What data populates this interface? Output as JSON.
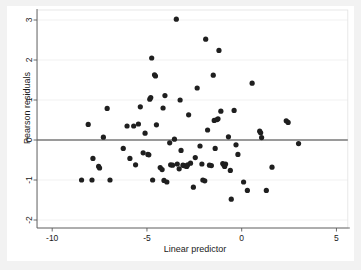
{
  "figure": {
    "background": "#f2f2f2",
    "plot_background": "#ffffff",
    "marker_color": "#1f1f1f",
    "gridline_color": "#ebebeb",
    "zero_line_color": "#3d3d3d"
  },
  "chart_data": {
    "type": "scatter",
    "title": "",
    "subtitle": "",
    "xlabel": "Linear predictor",
    "ylabel": "Pearson residuals",
    "xlim": [
      -10.8,
      5.6
    ],
    "ylim": [
      -2.2,
      3.25
    ],
    "xticks": [
      -10,
      -5,
      0,
      5
    ],
    "xticklabels": [
      "-10",
      "-5",
      "0",
      "5"
    ],
    "yticks": [
      -2,
      -1,
      0,
      1,
      2,
      3
    ],
    "yticklabels": [
      "-2",
      "-1",
      "0",
      "1",
      "2",
      "3"
    ],
    "grid": "horizontal",
    "legend": "none",
    "reference_lines": [
      {
        "axis": "y",
        "value": 0,
        "style": "solid"
      }
    ],
    "marker": {
      "shape": "circle",
      "size": 2.6
    },
    "series": [
      {
        "name": "Pearson residuals",
        "points": [
          [
            -8.45,
            -1.0
          ],
          [
            -8.1,
            0.39
          ],
          [
            -7.9,
            -1.0
          ],
          [
            -7.85,
            -0.46
          ],
          [
            -7.55,
            -0.66
          ],
          [
            -7.5,
            -0.7
          ],
          [
            -7.3,
            0.07
          ],
          [
            -7.1,
            0.79
          ],
          [
            -6.95,
            -1.0
          ],
          [
            -6.25,
            -0.21
          ],
          [
            -6.05,
            0.35
          ],
          [
            -5.9,
            -0.46
          ],
          [
            -5.7,
            0.35
          ],
          [
            -5.6,
            -0.62
          ],
          [
            -5.45,
            0.4
          ],
          [
            -5.35,
            0.83
          ],
          [
            -5.2,
            -0.32
          ],
          [
            -5.1,
            0.17
          ],
          [
            -4.95,
            -0.36
          ],
          [
            -4.9,
            -0.37
          ],
          [
            -4.85,
            1.02
          ],
          [
            -4.8,
            1.06
          ],
          [
            -4.75,
            2.05
          ],
          [
            -4.7,
            -1.0
          ],
          [
            -4.6,
            1.63
          ],
          [
            -4.55,
            1.6
          ],
          [
            -4.5,
            0.38
          ],
          [
            -4.3,
            -0.69
          ],
          [
            -4.2,
            -0.74
          ],
          [
            -4.15,
            0.8
          ],
          [
            -4.1,
            -1.01
          ],
          [
            -4.05,
            1.11
          ],
          [
            -3.95,
            -1.05
          ],
          [
            -3.8,
            -0.07
          ],
          [
            -3.75,
            -0.62
          ],
          [
            -3.65,
            -0.63
          ],
          [
            -3.55,
            0.02
          ],
          [
            -3.45,
            3.02
          ],
          [
            -3.4,
            -0.6
          ],
          [
            -3.3,
            -0.72
          ],
          [
            -3.25,
            1.0
          ],
          [
            -3.2,
            -0.26
          ],
          [
            -3.1,
            -0.63
          ],
          [
            -3.05,
            -0.64
          ],
          [
            -2.95,
            -0.65
          ],
          [
            -2.9,
            -0.66
          ],
          [
            -2.85,
            -0.62
          ],
          [
            -2.8,
            0.63
          ],
          [
            -2.7,
            -0.58
          ],
          [
            -2.55,
            -1.18
          ],
          [
            -2.45,
            -0.44
          ],
          [
            -2.35,
            1.3
          ],
          [
            -2.2,
            -0.15
          ],
          [
            -2.1,
            -0.6
          ],
          [
            -2.05,
            -1.0
          ],
          [
            -1.95,
            -1.02
          ],
          [
            -1.9,
            2.52
          ],
          [
            -1.8,
            0.25
          ],
          [
            -1.7,
            -0.63
          ],
          [
            -1.6,
            -0.64
          ],
          [
            -1.5,
            1.62
          ],
          [
            -1.45,
            0.49
          ],
          [
            -1.4,
            -0.21
          ],
          [
            -1.3,
            0.51
          ],
          [
            -1.25,
            0.53
          ],
          [
            -1.2,
            2.24
          ],
          [
            -1.1,
            0.72
          ],
          [
            -1.0,
            -0.59
          ],
          [
            -0.95,
            -0.62
          ],
          [
            -0.9,
            -0.66
          ],
          [
            -0.85,
            -0.6
          ],
          [
            -0.7,
            0.08
          ],
          [
            -0.6,
            -0.76
          ],
          [
            -0.55,
            -1.48
          ],
          [
            -0.4,
            0.74
          ],
          [
            -0.3,
            -0.12
          ],
          [
            -0.2,
            -0.36
          ],
          [
            0.1,
            -1.05
          ],
          [
            0.3,
            -1.26
          ],
          [
            0.55,
            1.42
          ],
          [
            0.95,
            0.22
          ],
          [
            1.0,
            0.18
          ],
          [
            1.05,
            0.06
          ],
          [
            1.3,
            -1.26
          ],
          [
            1.6,
            -0.68
          ],
          [
            2.35,
            0.48
          ],
          [
            2.45,
            0.44
          ],
          [
            3.0,
            -0.09
          ]
        ]
      }
    ]
  }
}
